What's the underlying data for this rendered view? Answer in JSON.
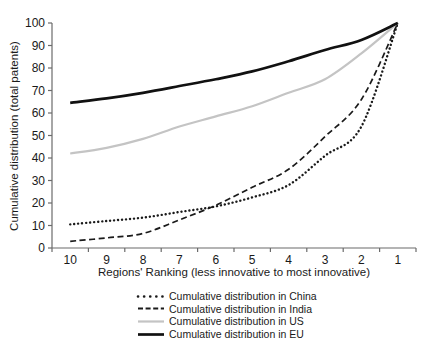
{
  "chart_data": {
    "type": "line",
    "xlabel": "Regions' Ranking (less innovative to most innovative)",
    "ylabel": "Cumulative distribution (total patents)",
    "x_categories": [
      "10",
      "9",
      "8",
      "7",
      "6",
      "5",
      "4",
      "3",
      "2",
      "1"
    ],
    "y_ticks": [
      0,
      10,
      20,
      30,
      40,
      50,
      60,
      70,
      80,
      90,
      100
    ],
    "ylim": [
      0,
      100
    ],
    "grid": false,
    "legend_position": "bottom",
    "axis_color": "#6b6b6b",
    "text_color": "#1a1a1a",
    "series": [
      {
        "id": "china",
        "name": "Cumulative distribution in China",
        "style": "dotted",
        "color": "#1a1a1a",
        "width": 2.4,
        "values": [
          10.5,
          12,
          13.5,
          16,
          18.5,
          22.5,
          28,
          41,
          54,
          100
        ]
      },
      {
        "id": "india",
        "name": "Cumulative distribution in India",
        "style": "dashed",
        "color": "#1a1a1a",
        "width": 1.7,
        "values": [
          3,
          4.5,
          6.5,
          12.5,
          19,
          27,
          35,
          49.5,
          66,
          100
        ]
      },
      {
        "id": "us",
        "name": "Cumulative distribution in US",
        "style": "solid",
        "color": "#c4c4c4",
        "width": 2.2,
        "values": [
          42,
          44.5,
          48.5,
          54,
          58.5,
          63,
          69,
          75,
          86.5,
          100
        ]
      },
      {
        "id": "eu",
        "name": "Cumulative distribution in EU",
        "style": "solid-thick",
        "color": "#111111",
        "width": 2.7,
        "values": [
          64.5,
          66.5,
          69,
          72,
          75,
          78.5,
          83,
          88,
          92.5,
          100
        ]
      }
    ]
  }
}
